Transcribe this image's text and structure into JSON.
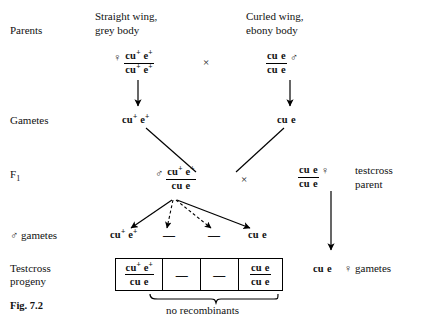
{
  "figure": {
    "caption": "Fig. 7.2",
    "brace_label": "no recombinants"
  },
  "row_labels": {
    "parents": "Parents",
    "gametes": "Gametes",
    "f1_text": "F",
    "f1_sub": "1",
    "male_gametes": "gametes",
    "testcross_progeny_line1": "Testcross",
    "testcross_progeny_line2": "progeny"
  },
  "symbols": {
    "female": "♀",
    "male": "♂",
    "cross": "×",
    "dash": "—"
  },
  "phenotypes": {
    "left_line1": "Straight wing,",
    "left_line2": "grey body",
    "right_line1": "Curled wing,",
    "right_line2": "ebony body"
  },
  "alleles": {
    "cu_plus": "cu",
    "cu_plus_sup": "+",
    "e_plus": "e",
    "e_plus_sup": "+",
    "cu": "cu",
    "e": "e"
  },
  "parents": {
    "mother": {
      "sex": "♀",
      "top": "cu+ e+",
      "bottom": "cu+ e+"
    },
    "father": {
      "sex": "♂",
      "top": "cu e",
      "bottom": "cu e"
    }
  },
  "gametes": {
    "maternal": "cu+ e+",
    "paternal": "cu e"
  },
  "f1": {
    "sex": "♂",
    "top": "cu+ e+",
    "bottom": "cu e"
  },
  "testcross_parent": {
    "sex": "♀",
    "top": "cu e",
    "bottom": "cu e",
    "label_line1": "testcross",
    "label_line2": "parent"
  },
  "female_gametes": {
    "genotype": "cu e",
    "sex": "♀",
    "label": "gametes"
  },
  "male_gametes_row": [
    {
      "kind": "genotype",
      "top": "cu+ e+"
    },
    {
      "kind": "dash",
      "text": "—"
    },
    {
      "kind": "dash",
      "text": "—"
    },
    {
      "kind": "genotype",
      "top": "cu e"
    }
  ],
  "progeny_cells": [
    {
      "kind": "genotype",
      "top": "cu+ e+",
      "bottom": "cu e"
    },
    {
      "kind": "dash",
      "text": "—"
    },
    {
      "kind": "dash",
      "text": "—"
    },
    {
      "kind": "genotype",
      "top": "cu e",
      "bottom": "cu e"
    }
  ],
  "colors": {
    "ink": "#111111",
    "background": "#ffffff",
    "rule": "#000000"
  }
}
